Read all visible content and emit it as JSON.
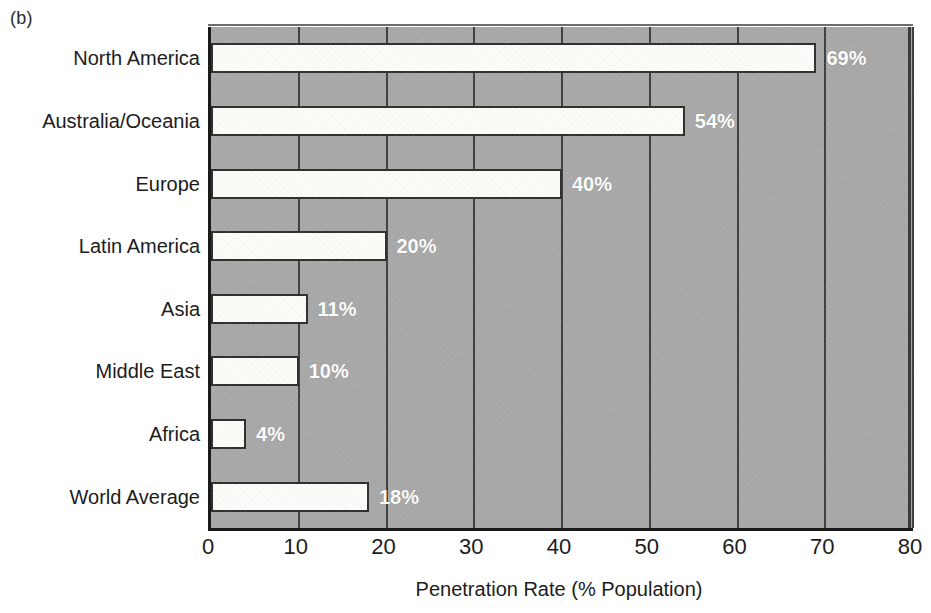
{
  "panel": {
    "letter": "(b)"
  },
  "chart_data": {
    "type": "bar",
    "orientation": "horizontal",
    "title": "",
    "subtitle": "",
    "xlabel": "Penetration Rate (% Population)",
    "ylabel": "",
    "xlim": [
      0,
      80
    ],
    "xticks": [
      0,
      10,
      20,
      30,
      40,
      50,
      60,
      70,
      80
    ],
    "xtick_labels": [
      "0",
      "10",
      "20",
      "30",
      "40",
      "50",
      "60",
      "70",
      "80"
    ],
    "grid": true,
    "legend": null,
    "categories": [
      "North America",
      "Australia/Oceania",
      "Europe",
      "Latin America",
      "Asia",
      "Middle East",
      "Africa",
      "World Average"
    ],
    "values": [
      69,
      54,
      40,
      20,
      11,
      10,
      4,
      18
    ],
    "data_labels": [
      "69%",
      "54%",
      "40%",
      "20%",
      "11%",
      "10%",
      "4%",
      "18%"
    ],
    "colors": {
      "bar_fill": "#fbfbf8",
      "bar_border": "#2e2e2e",
      "plot_background": "#a8a8a8",
      "axis": "#1a1a1a",
      "gridline": "#3f3f3f",
      "data_label_text": "#ffffff",
      "text": "#1c1c1c"
    }
  }
}
